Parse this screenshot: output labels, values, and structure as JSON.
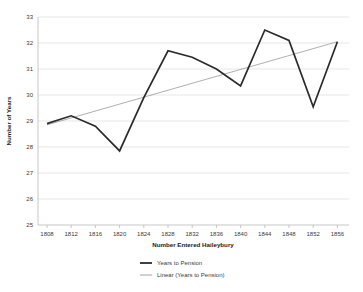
{
  "chart_data": {
    "type": "line",
    "title": "",
    "xlabel": "Number Entered Haileybury",
    "ylabel": "Number of Years",
    "x": [
      1808,
      1812,
      1816,
      1820,
      1824,
      1828,
      1832,
      1836,
      1840,
      1844,
      1848,
      1852,
      1856
    ],
    "xticklabels": [
      "1808",
      "1812",
      "1816",
      "1820",
      "1824",
      "1828",
      "1832",
      "1836",
      "1840",
      "1844",
      "1848",
      "1852",
      "1856"
    ],
    "yticklabels": [
      "25",
      "26",
      "27",
      "28",
      "29",
      "30",
      "31",
      "32",
      "33"
    ],
    "yticks": [
      25,
      26,
      27,
      28,
      29,
      30,
      31,
      32,
      33
    ],
    "xlim": [
      1806,
      1858
    ],
    "ylim": [
      25,
      33
    ],
    "grid": "horizontal",
    "legend_position": "bottom",
    "series": [
      {
        "name": "Years to Pension",
        "kind": "data",
        "color": "#2b2b2b",
        "values": [
          28.9,
          29.2,
          28.8,
          27.85,
          29.9,
          31.7,
          31.45,
          31.0,
          30.35,
          32.5,
          32.1,
          29.55,
          32.05
        ]
      },
      {
        "name": "Linear (Years to Pension)",
        "kind": "trendline",
        "color": "#9a9a9a",
        "values": [
          28.85,
          29.12,
          29.38,
          29.65,
          29.92,
          30.18,
          30.45,
          30.72,
          30.98,
          31.25,
          31.52,
          31.78,
          32.05
        ]
      }
    ]
  },
  "legend": {
    "items": [
      {
        "label": "Years to Pension"
      },
      {
        "label": "Linear (Years to Pension)"
      }
    ]
  },
  "axes": {
    "x_title": "Number Entered Haileybury",
    "y_title": "Number of Years"
  }
}
